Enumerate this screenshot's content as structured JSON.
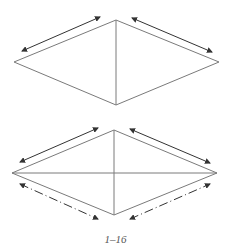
{
  "figure": {
    "caption": "1–16",
    "stroke_color": "#7a7a7a",
    "arrow_color": "#333333"
  },
  "diagrams": [
    {
      "name": "top-diamond",
      "vertices": {
        "left": [
          14,
          62
        ],
        "top": [
          116,
          20
        ],
        "right": [
          219,
          62
        ],
        "bottom": [
          116,
          105
        ]
      },
      "diagonals": [
        "vertical"
      ],
      "arrows": [
        {
          "from": [
            22,
            51
          ],
          "to": [
            100,
            17
          ],
          "style": "solid"
        },
        {
          "from": [
            132,
            18
          ],
          "to": [
            212,
            52
          ],
          "style": "solid"
        }
      ]
    },
    {
      "name": "bottom-diamond",
      "vertices": {
        "left": [
          12,
          173
        ],
        "top": [
          114,
          130
        ],
        "right": [
          217,
          173
        ],
        "bottom": [
          114,
          215
        ]
      },
      "diagonals": [
        "vertical",
        "horizontal"
      ],
      "arrows": [
        {
          "from": [
            20,
            162
          ],
          "to": [
            98,
            128
          ],
          "style": "solid"
        },
        {
          "from": [
            130,
            129
          ],
          "to": [
            210,
            163
          ],
          "style": "solid"
        },
        {
          "from": [
            20,
            184
          ],
          "to": [
            98,
            219
          ],
          "style": "dashed"
        },
        {
          "from": [
            130,
            219
          ],
          "to": [
            210,
            184
          ],
          "style": "dashed"
        }
      ]
    }
  ]
}
